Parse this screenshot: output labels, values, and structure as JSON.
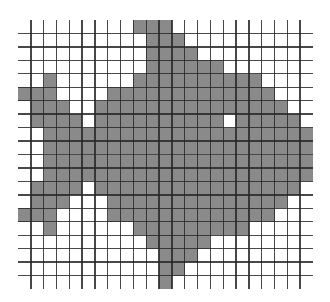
{
  "figure": {
    "title": "",
    "cols": 23,
    "rows": 20,
    "fill_color": "#8a8a8a",
    "line_color": "#282828",
    "background_color": "#ffffff",
    "filled_runs": [
      [
        [
          9,
          11
        ]
      ],
      [
        [
          10,
          12
        ]
      ],
      [
        [
          10,
          13
        ]
      ],
      [
        [
          10,
          15
        ]
      ],
      [
        [
          2,
          2
        ],
        [
          9,
          18
        ]
      ],
      [
        [
          0,
          2
        ],
        [
          7,
          19
        ]
      ],
      [
        [
          1,
          3
        ],
        [
          6,
          20
        ]
      ],
      [
        [
          1,
          4
        ],
        [
          6,
          15
        ],
        [
          17,
          21
        ]
      ],
      [
        [
          2,
          22
        ]
      ],
      [
        [
          2,
          22
        ]
      ],
      [
        [
          2,
          22
        ]
      ],
      [
        [
          2,
          22
        ]
      ],
      [
        [
          1,
          4
        ],
        [
          6,
          21
        ]
      ],
      [
        [
          1,
          3
        ],
        [
          7,
          20
        ]
      ],
      [
        [
          0,
          2
        ],
        [
          7,
          19
        ]
      ],
      [
        [
          2,
          2
        ],
        [
          9,
          17
        ]
      ],
      [
        [
          10,
          14
        ]
      ],
      [
        [
          11,
          13
        ]
      ],
      [
        [
          11,
          12
        ]
      ],
      [
        [
          11,
          11
        ]
      ]
    ]
  }
}
